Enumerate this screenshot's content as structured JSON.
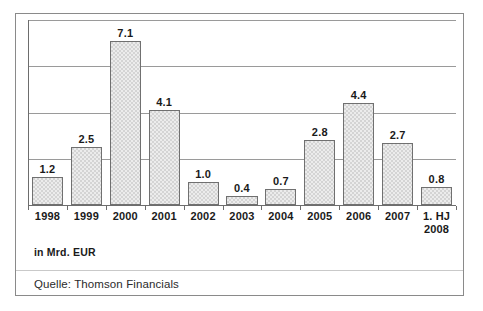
{
  "chart_data": {
    "type": "bar",
    "title": "",
    "subtitle": "",
    "xlabel": "",
    "ylabel": "in Mrd. EUR",
    "categories": [
      "1998",
      "1999",
      "2000",
      "2001",
      "2002",
      "2003",
      "2004",
      "2005",
      "2006",
      "2007",
      "1. HJ\n2008"
    ],
    "category_lines": [
      [
        "1998"
      ],
      [
        "1999"
      ],
      [
        "2000"
      ],
      [
        "2001"
      ],
      [
        "2002"
      ],
      [
        "2003"
      ],
      [
        "2004"
      ],
      [
        "2005"
      ],
      [
        "2006"
      ],
      [
        "2007"
      ],
      [
        "1. HJ",
        "2008"
      ]
    ],
    "values": [
      1.2,
      2.5,
      7.1,
      4.1,
      1.0,
      0.4,
      0.7,
      2.8,
      4.4,
      2.7,
      0.8
    ],
    "value_labels": [
      "1.2",
      "2.5",
      "7.1",
      "4.1",
      "1.0",
      "0.4",
      "0.7",
      "2.8",
      "4.4",
      "2.7",
      "0.8"
    ],
    "ylim": [
      0,
      8
    ],
    "y_gridlines": [
      2,
      4,
      6,
      8
    ],
    "grid": true,
    "legend": "none",
    "bar_fill_color": "#d4d4d4",
    "bar_border_color": "#707070",
    "gridline_color": "#9a9a9a",
    "axis_color": "#6d6d6d",
    "text_color": "#1a1a1a"
  },
  "figure": {
    "unit_note": "in Mrd. EUR",
    "source_note": "Quelle: Thomson Financials",
    "frame_color": "#8a8a8a",
    "background_color": "#ffffff"
  }
}
